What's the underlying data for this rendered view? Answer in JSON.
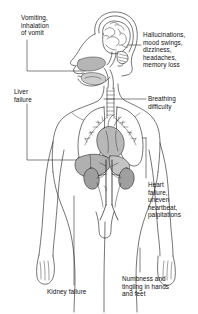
{
  "diagram": {
    "figure": {
      "name": "human-body-anatomical-figure",
      "view": "frontal body with left-facing head profile",
      "organs": [
        "brain",
        "nasal cavity",
        "oral cavity",
        "trachea",
        "lungs",
        "heart",
        "liver",
        "kidneys",
        "ureters",
        "aorta"
      ]
    },
    "line_color": "#1a1a1a",
    "text_color": "#111111",
    "organ_shade": "#a9a9a9",
    "labels": [
      {
        "id": "vomiting",
        "text": "Vomiting,\ninhalation\nof vomit",
        "target": "mouth",
        "side": "left"
      },
      {
        "id": "hallucinations",
        "text": "Hallucinations,\nmood swings,\ndizziness,\nheadaches,\nmemory loss",
        "target": "brain",
        "side": "right"
      },
      {
        "id": "liver-failure",
        "text": "Liver\nfailure",
        "target": "liver",
        "side": "left"
      },
      {
        "id": "breathing-difficulty",
        "text": "Breathing\ndifficulty",
        "target": "lung",
        "side": "right"
      },
      {
        "id": "heart-failure",
        "text": "Heart\nfailure,\nuneven\nheartbeat,\npalpitations",
        "target": "heart",
        "side": "right"
      },
      {
        "id": "kidney-failure",
        "text": "Kidney failure",
        "target": "kidney",
        "side": "bottom-left"
      },
      {
        "id": "numbness",
        "text": "Numbness and\ntingling in hands\nand feet",
        "target": "hand",
        "side": "bottom-right"
      }
    ]
  }
}
